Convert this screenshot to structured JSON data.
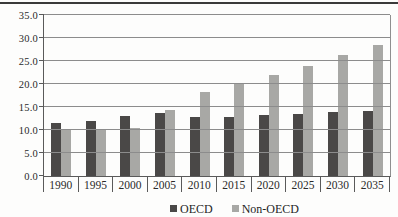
{
  "colors": {
    "oecd_bar": "#4a4847",
    "non_oecd_bar": "#a8a8a5",
    "gridline": "#8c8c8c",
    "axis": "#5a5a5a",
    "top_rule": "#3a3a3a",
    "text": "#2a2a2a"
  },
  "legend": {
    "items": [
      {
        "label": "OECD",
        "color": "#4a4847"
      },
      {
        "label": "Non-OECD",
        "color": "#a8a8a5"
      }
    ]
  },
  "chart_data": {
    "type": "bar",
    "title": "",
    "xlabel": "",
    "ylabel": "",
    "categories": [
      "1990",
      "1995",
      "2000",
      "2005",
      "2010",
      "2015",
      "2020",
      "2025",
      "2030",
      "2035"
    ],
    "series": [
      {
        "name": "OECD",
        "color": "#4a4847",
        "values": [
          11.6,
          12.0,
          13.0,
          13.7,
          12.8,
          12.9,
          13.3,
          13.5,
          13.9,
          14.1
        ]
      },
      {
        "name": "Non-OECD",
        "color": "#a8a8a5",
        "values": [
          10.0,
          10.0,
          10.5,
          14.4,
          18.3,
          20.3,
          21.9,
          24.0,
          26.3,
          28.5
        ]
      }
    ],
    "ylim": [
      0,
      35
    ],
    "yticks": [
      {
        "value": 0,
        "label": "0.0"
      },
      {
        "value": 5,
        "label": "5.0"
      },
      {
        "value": 10,
        "label": "10.0"
      },
      {
        "value": 15,
        "label": "15.0"
      },
      {
        "value": 20,
        "label": "20.0"
      },
      {
        "value": 25,
        "label": "25.0"
      },
      {
        "value": 30,
        "label": "30.0"
      },
      {
        "value": 35,
        "label": "35.0"
      }
    ],
    "grid": true,
    "legend_position": "bottom-center"
  }
}
